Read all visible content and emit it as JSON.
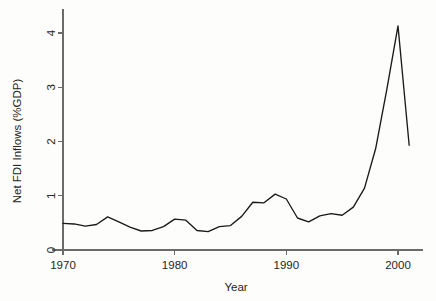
{
  "chart_data": {
    "type": "line",
    "title": "",
    "xlabel": "Year",
    "ylabel": "Net FDI Inflows (%GDP)",
    "xlim": [
      1969.0,
      2002.2
    ],
    "ylim": [
      0,
      4.45
    ],
    "xticks": [
      1970,
      1980,
      1990,
      2000
    ],
    "xtick_labels": [
      "1970",
      "1980",
      "1990",
      "2000"
    ],
    "yticks": [
      0,
      1,
      2,
      3,
      4
    ],
    "ytick_labels": [
      "0",
      "1",
      "2",
      "3",
      "4"
    ],
    "grid": false,
    "legend": false,
    "legend_position": "none",
    "line_color": "#1a1a1a",
    "axis_color": "#6b6b6b",
    "background_color": "#fdfdfb",
    "x": [
      1970,
      1971,
      1972,
      1973,
      1974,
      1975,
      1976,
      1977,
      1978,
      1979,
      1980,
      1981,
      1982,
      1983,
      1984,
      1985,
      1986,
      1987,
      1988,
      1989,
      1990,
      1991,
      1992,
      1993,
      1994,
      1995,
      1996,
      1997,
      1998,
      1999,
      2000,
      2001
    ],
    "series": [
      {
        "name": "Net FDI Inflows (%GDP)",
        "values": [
          0.49,
          0.48,
          0.44,
          0.47,
          0.61,
          0.52,
          0.42,
          0.35,
          0.36,
          0.43,
          0.57,
          0.55,
          0.36,
          0.34,
          0.43,
          0.45,
          0.62,
          0.88,
          0.87,
          1.03,
          0.94,
          0.59,
          0.52,
          0.63,
          0.67,
          0.64,
          0.79,
          1.14,
          1.87,
          2.96,
          4.13,
          1.93
        ]
      }
    ]
  },
  "axis_labels": {
    "x_title": "Year",
    "y_title": "Net FDI Inflows (%GDP)"
  }
}
